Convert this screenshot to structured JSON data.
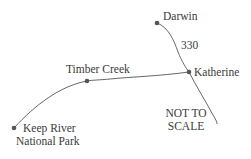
{
  "map": {
    "colors": {
      "road": "#555555",
      "dot": "#555555",
      "text": "#3a3a3a"
    },
    "places": [
      {
        "name": "Darwin",
        "x": 157,
        "y": 23
      },
      {
        "name": "Katherine",
        "x": 189,
        "y": 72
      },
      {
        "name": "Timber Creek",
        "x": 87,
        "y": 81
      },
      {
        "name": "Keep River",
        "name2": "National Park",
        "x": 14,
        "y": 128
      }
    ],
    "distance_label": "330",
    "scale_note": {
      "line1": "NOT TO",
      "line2": "SCALE"
    }
  }
}
